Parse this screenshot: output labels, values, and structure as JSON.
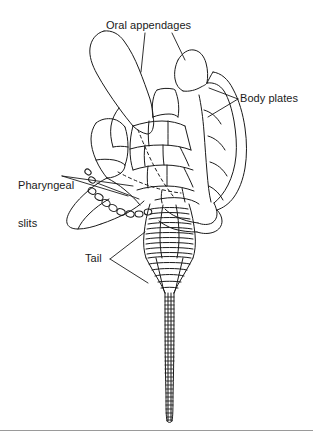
{
  "figure": {
    "kind": "line-drawing",
    "background_color": "#ffffff",
    "ink_color": "#1a1a1a",
    "rule_color": "#9a9a9a",
    "width": 313,
    "height": 443
  },
  "labels": {
    "oral_appendages": "Oral appendages",
    "body_plates": "Body plates",
    "pharyngeal_slits_line1": "Pharyngeal",
    "pharyngeal_slits_line2": "slits",
    "tail": "Tail"
  },
  "parts": {
    "oral_appendages": "oral-appendages",
    "body_plates": "body-plates",
    "pharyngeal_slits": "pharyngeal-slits",
    "tail": "tail",
    "tail_base": "tail-base",
    "tail_shaft": "tail-shaft",
    "body_outline": "body-outline"
  }
}
